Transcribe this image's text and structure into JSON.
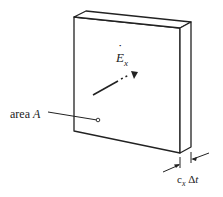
{
  "diagram": {
    "type": "slab-wave-volume",
    "labels": {
      "area": "area A",
      "area_prefix": "area ",
      "area_var": "A",
      "field": "E",
      "field_sub": "x",
      "field_dot": "˙",
      "thickness_c": "c",
      "thickness_c_sub": "x",
      "thickness_delta": " Δ",
      "thickness_t": "t"
    },
    "colors": {
      "stroke": "#222222",
      "background": "#ffffff"
    }
  }
}
